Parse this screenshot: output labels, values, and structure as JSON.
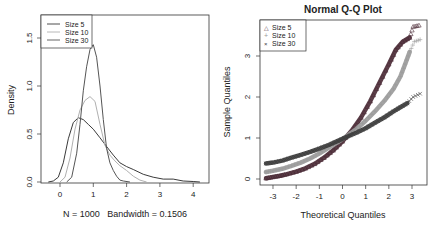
{
  "chart_data": [
    {
      "type": "line",
      "title": "",
      "xlabel": "N = 1000   Bandwidth = 0.1506",
      "ylabel": "Density",
      "xlim": [
        -0.6,
        4.3
      ],
      "ylim": [
        0,
        1.72
      ],
      "xticks": [
        0,
        1,
        2,
        3,
        4
      ],
      "yticks": [
        "0.0",
        "0.5",
        "1.0",
        "1.5"
      ],
      "legend": {
        "position": "topleft",
        "entries": [
          "Size 5",
          "Size 10",
          "Size 30"
        ]
      },
      "series": [
        {
          "name": "Size 5",
          "color": "#3a3a3a",
          "x": [
            -0.35,
            -0.2,
            -0.05,
            0.1,
            0.25,
            0.4,
            0.55,
            0.7,
            0.85,
            1.0,
            1.2,
            1.4,
            1.6,
            1.8,
            2.0,
            2.2,
            2.5,
            2.8,
            3.1,
            3.4,
            3.7,
            4.0,
            4.2
          ],
          "y": [
            0.0,
            0.01,
            0.05,
            0.2,
            0.45,
            0.62,
            0.67,
            0.65,
            0.6,
            0.55,
            0.46,
            0.37,
            0.28,
            0.2,
            0.16,
            0.13,
            0.08,
            0.05,
            0.03,
            0.03,
            0.01,
            0.005,
            0.0
          ]
        },
        {
          "name": "Size 10",
          "color": "#b0b0b0",
          "x": [
            0.0,
            0.15,
            0.3,
            0.45,
            0.6,
            0.75,
            0.9,
            1.05,
            1.2,
            1.35,
            1.5,
            1.65,
            1.8,
            2.0,
            2.2,
            2.4,
            2.6
          ],
          "y": [
            0.0,
            0.05,
            0.25,
            0.55,
            0.75,
            0.85,
            0.89,
            0.84,
            0.6,
            0.38,
            0.28,
            0.22,
            0.17,
            0.12,
            0.06,
            0.02,
            0.0
          ]
        },
        {
          "name": "Size 30",
          "color": "#555555",
          "x": [
            0.2,
            0.35,
            0.5,
            0.6,
            0.7,
            0.8,
            0.9,
            1.0,
            1.1,
            1.2,
            1.3,
            1.4,
            1.5,
            1.6,
            1.7,
            1.8,
            1.9,
            2.1
          ],
          "y": [
            0.0,
            0.05,
            0.3,
            0.6,
            0.95,
            1.2,
            1.38,
            1.43,
            1.3,
            1.0,
            0.65,
            0.35,
            0.2,
            0.12,
            0.06,
            0.02,
            0.01,
            0.0
          ]
        }
      ]
    },
    {
      "type": "scatter",
      "title": "Normal Q-Q Plot",
      "xlabel": "Theoretical Quantiles",
      "ylabel": "Sample Quantiles",
      "xlim": [
        -3.55,
        3.55
      ],
      "ylim": [
        -0.15,
        3.65
      ],
      "xticks": [
        -3,
        -2,
        -1,
        0,
        1,
        2,
        3
      ],
      "yticks": [
        0,
        1,
        2,
        3
      ],
      "legend": {
        "position": "topleft",
        "entries": [
          "Size 5",
          "Size 10",
          "Size 30"
        ]
      },
      "series": [
        {
          "name": "Size 5",
          "marker": "triangle",
          "color": "#4a2a35",
          "x": [
            -3.3,
            -3.0,
            -2.7,
            -2.4,
            -2.0,
            -1.6,
            -1.2,
            -0.8,
            -0.4,
            0.0,
            0.4,
            0.8,
            1.2,
            1.6,
            2.0,
            2.3,
            2.6,
            2.9,
            3.05,
            3.3
          ],
          "y": [
            0.02,
            0.05,
            0.08,
            0.12,
            0.18,
            0.26,
            0.37,
            0.52,
            0.7,
            0.92,
            1.18,
            1.5,
            1.9,
            2.35,
            2.8,
            3.15,
            3.35,
            3.45,
            3.72,
            3.75
          ]
        },
        {
          "name": "Size 10",
          "marker": "plus",
          "color": "#9a9a9a",
          "x": [
            -3.3,
            -3.0,
            -2.6,
            -2.2,
            -1.8,
            -1.4,
            -1.0,
            -0.6,
            -0.2,
            0.2,
            0.6,
            1.0,
            1.4,
            1.8,
            2.2,
            2.5,
            2.7,
            2.9,
            3.1,
            3.35
          ],
          "y": [
            0.17,
            0.2,
            0.25,
            0.32,
            0.4,
            0.5,
            0.62,
            0.76,
            0.9,
            1.05,
            1.22,
            1.42,
            1.65,
            1.9,
            2.2,
            2.5,
            2.8,
            3.1,
            3.35,
            3.4
          ]
        },
        {
          "name": "Size 30",
          "marker": "cross",
          "color": "#3a3a3a",
          "x": [
            -3.3,
            -3.0,
            -2.6,
            -2.2,
            -1.8,
            -1.4,
            -1.0,
            -0.6,
            -0.2,
            0.2,
            0.6,
            1.0,
            1.4,
            1.8,
            2.2,
            2.5,
            2.8,
            3.05,
            3.35
          ],
          "y": [
            0.38,
            0.4,
            0.45,
            0.52,
            0.59,
            0.66,
            0.74,
            0.83,
            0.93,
            1.03,
            1.13,
            1.24,
            1.37,
            1.5,
            1.65,
            1.75,
            1.85,
            2.0,
            2.08
          ]
        }
      ]
    }
  ],
  "density_plot": {
    "ylabel": "Density",
    "xlabel": "N = 1000   Bandwidth = 0.1506",
    "legend": [
      "Size 5",
      "Size 10",
      "Size 30"
    ]
  },
  "qq_plot": {
    "title": "Normal Q-Q Plot",
    "xlabel": "Theoretical Quantiles",
    "ylabel": "Sample Quantiles",
    "legend": [
      "Size 5",
      "Size 10",
      "Size 30"
    ]
  }
}
